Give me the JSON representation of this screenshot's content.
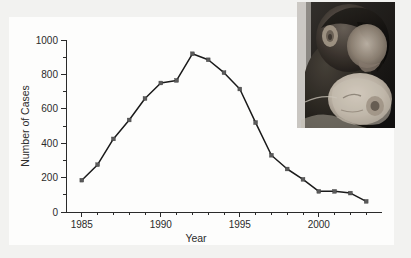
{
  "chart_data": {
    "type": "line",
    "title": "",
    "xlabel": "Year",
    "ylabel": "Number of Cases",
    "xlim": [
      1984,
      2004
    ],
    "ylim": [
      0,
      1000
    ],
    "grid": false,
    "legend": "none",
    "x": [
      1985,
      1986,
      1987,
      1988,
      1989,
      1990,
      1991,
      1992,
      1993,
      1994,
      1995,
      1996,
      1997,
      1998,
      1999,
      2000,
      2001,
      2002,
      2003
    ],
    "values": [
      185,
      275,
      425,
      535,
      660,
      750,
      765,
      920,
      885,
      810,
      715,
      520,
      330,
      250,
      190,
      120,
      120,
      110,
      62
    ],
    "series": [
      {
        "name": "Number of Cases",
        "values": [
          185,
          275,
          425,
          535,
          660,
          750,
          765,
          920,
          885,
          810,
          715,
          520,
          330,
          250,
          190,
          120,
          120,
          110,
          62
        ]
      }
    ],
    "y_ticks_major": [
      0,
      200,
      400,
      600,
      800,
      1000
    ],
    "y_ticks_major_labels": [
      "0",
      "200",
      "400",
      "600",
      "800",
      "1000"
    ],
    "y_ticks_minor": [
      100,
      300,
      500,
      700,
      900
    ],
    "x_ticks_major": [
      1985,
      1990,
      1995,
      2000
    ],
    "x_ticks_major_labels": [
      "1985",
      "1990",
      "1995",
      "2000"
    ],
    "x_ticks_minor": [
      1986,
      1987,
      1988,
      1989,
      1991,
      1992,
      1993,
      1994,
      1996,
      1997,
      1998,
      1999,
      2001,
      2002,
      2003
    ],
    "line_color": "#1a1a1a",
    "marker_color": "#5a5a5a",
    "background_color": "#f2f2f0",
    "panel_color": "#fdfdfc"
  },
  "inset": {
    "name": "photograph-mother-kissing-infant",
    "description": "Black and white photograph of a mother kissing a newborn infant",
    "alt": "mother kissing infant"
  }
}
